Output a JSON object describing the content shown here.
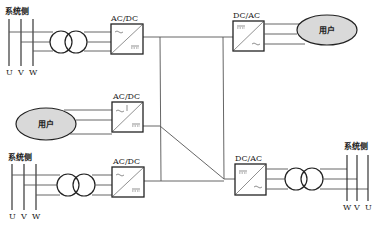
{
  "diagram": {
    "title": "",
    "colors": {
      "line": "#555555",
      "stroke": "#222222",
      "user_fill": "#d9d9d9",
      "background": "#ffffff"
    },
    "grid_sides": [
      {
        "id": "grid-top-left",
        "label": "系统侧",
        "phases": [
          "U",
          "V",
          "W"
        ]
      },
      {
        "id": "grid-bottom-left",
        "label": "系统侧",
        "phases": [
          "U",
          "V",
          "W"
        ]
      },
      {
        "id": "grid-bottom-right",
        "label": "系统侧",
        "phases": [
          "W",
          "V",
          "U"
        ]
      }
    ],
    "converters": [
      {
        "id": "conv-top-left",
        "label": "AC/DC",
        "input": "~",
        "output": "="
      },
      {
        "id": "conv-mid-left",
        "label": "AC/DC",
        "input": "~",
        "output": "="
      },
      {
        "id": "conv-bottom-left",
        "label": "AC/DC",
        "input": "~",
        "output": "="
      },
      {
        "id": "conv-top-right",
        "label": "DC/AC",
        "input": "=",
        "output": "~"
      },
      {
        "id": "conv-bottom-right",
        "label": "DC/AC",
        "input": "=",
        "output": "~"
      }
    ],
    "loads": [
      {
        "id": "user-top-right",
        "label": "用户"
      },
      {
        "id": "user-mid-left",
        "label": "用户"
      }
    ],
    "transformers": [
      {
        "id": "xfmr-top-left"
      },
      {
        "id": "xfmr-bottom-left"
      },
      {
        "id": "xfmr-bottom-right"
      }
    ],
    "dc_bus": {
      "description": "DC network interconnecting all converters"
    }
  }
}
